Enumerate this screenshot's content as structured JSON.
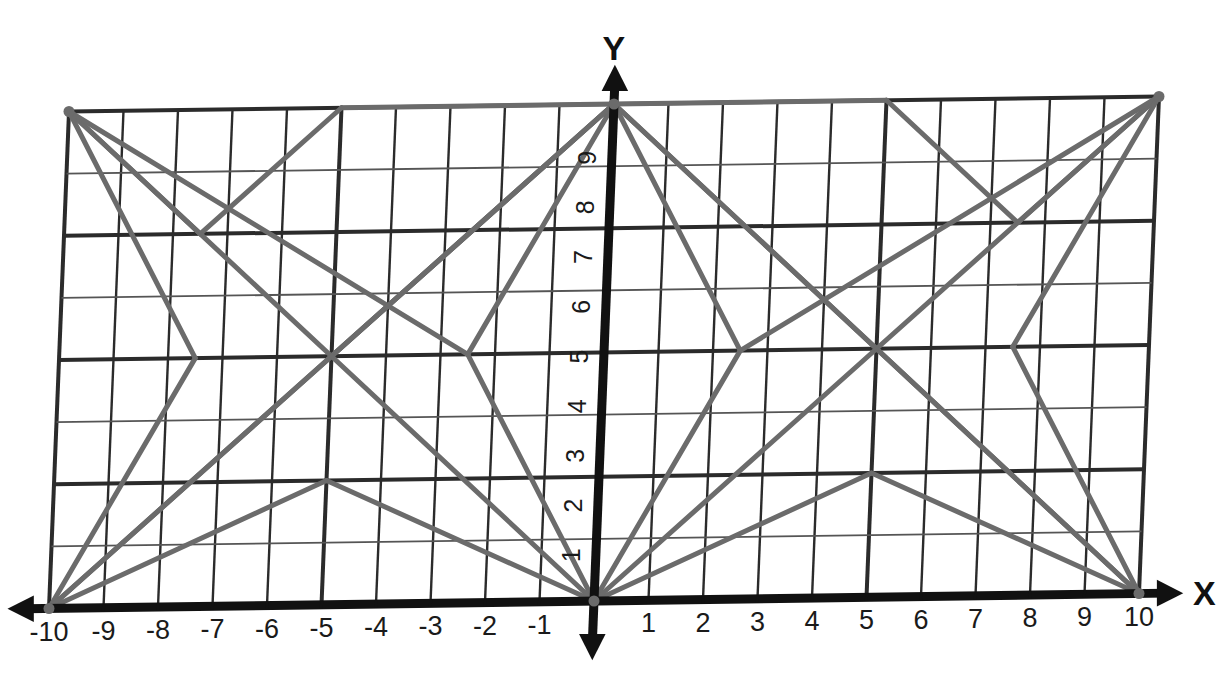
{
  "figure": {
    "title": "",
    "type": "coordinate-plane-line-figure",
    "axis_labels": {
      "x": "X",
      "y": "Y"
    },
    "colors": {
      "grid_major": "#2b2b2b",
      "grid_minor": "#555555",
      "axis": "#111111",
      "figure_line": "#6b6b6b",
      "background": "#ffffff"
    }
  },
  "chart_data": {
    "type": "line",
    "title": "",
    "xlabel": "X",
    "ylabel": "Y",
    "xlim": [
      -10,
      10
    ],
    "ylim": [
      0,
      10
    ],
    "grid": true,
    "legend": "none",
    "x_ticks": [
      "-10",
      "-9",
      "-8",
      "-7",
      "-6",
      "-5",
      "-4",
      "-3",
      "-2",
      "-1",
      "0",
      "1",
      "2",
      "3",
      "4",
      "5",
      "6",
      "7",
      "8",
      "9",
      "10"
    ],
    "y_ticks": [
      "1",
      "2",
      "3",
      "4",
      "5",
      "6",
      "7",
      "8",
      "9"
    ],
    "x_tick_values": [
      -10,
      -9,
      -8,
      -7,
      -6,
      -5,
      -4,
      -3,
      -2,
      -1,
      0,
      1,
      2,
      3,
      4,
      5,
      6,
      7,
      8,
      9,
      10
    ],
    "y_tick_values": [
      1,
      2,
      3,
      4,
      5,
      6,
      7,
      8,
      9
    ],
    "key_points": [
      {
        "name": "top-left-corner",
        "x": -10,
        "y": 10
      },
      {
        "name": "top-center-apex",
        "x": 0,
        "y": 10
      },
      {
        "name": "top-right-corner",
        "x": 10,
        "y": 10
      },
      {
        "name": "left-wing-notch",
        "x": -7.5,
        "y": 7.5
      },
      {
        "name": "right-wing-notch",
        "x": 7.5,
        "y": 7.5
      },
      {
        "name": "left-mid-node",
        "x": -7.5,
        "y": 5
      },
      {
        "name": "right-mid-node",
        "x": 7.5,
        "y": 5
      },
      {
        "name": "left-cross-center",
        "x": -5,
        "y": 5
      },
      {
        "name": "right-cross-center",
        "x": 5,
        "y": 5
      },
      {
        "name": "inner-left-node",
        "x": -2.5,
        "y": 5
      },
      {
        "name": "inner-right-node",
        "x": 2.5,
        "y": 5
      },
      {
        "name": "left-peak",
        "x": -5,
        "y": 2.5
      },
      {
        "name": "right-peak",
        "x": 5,
        "y": 2.5
      },
      {
        "name": "bottom-left-corner",
        "x": -10,
        "y": 0
      },
      {
        "name": "origin",
        "x": 0,
        "y": 0
      },
      {
        "name": "bottom-right-corner",
        "x": 10,
        "y": 0
      }
    ],
    "segments": [
      {
        "from": [
          -10,
          10
        ],
        "to": [
          -7.5,
          7.5
        ]
      },
      {
        "from": [
          -7.5,
          7.5
        ],
        "to": [
          -5,
          10
        ]
      },
      {
        "from": [
          -5,
          10
        ],
        "to": [
          0,
          10
        ]
      },
      {
        "from": [
          -10,
          10
        ],
        "to": [
          -5,
          5
        ]
      },
      {
        "from": [
          -5,
          5
        ],
        "to": [
          0,
          10
        ]
      },
      {
        "from": [
          -10,
          10
        ],
        "to": [
          -2.5,
          5
        ]
      },
      {
        "from": [
          -2.5,
          5
        ],
        "to": [
          0,
          10
        ]
      },
      {
        "from": [
          -10,
          10
        ],
        "to": [
          -7.5,
          5
        ]
      },
      {
        "from": [
          -7.5,
          5
        ],
        "to": [
          -10,
          0
        ]
      },
      {
        "from": [
          -10,
          0
        ],
        "to": [
          -5,
          5
        ]
      },
      {
        "from": [
          -5,
          5
        ],
        "to": [
          0,
          10
        ]
      },
      {
        "from": [
          -10,
          0
        ],
        "to": [
          -5,
          2.5
        ]
      },
      {
        "from": [
          -5,
          2.5
        ],
        "to": [
          0,
          0
        ]
      },
      {
        "from": [
          -10,
          0
        ],
        "to": [
          0,
          10
        ]
      },
      {
        "from": [
          -2.5,
          5
        ],
        "to": [
          0,
          0
        ]
      },
      {
        "from": [
          0,
          0
        ],
        "to": [
          -5,
          5
        ]
      },
      {
        "from": [
          10,
          10
        ],
        "to": [
          7.5,
          7.5
        ]
      },
      {
        "from": [
          7.5,
          7.5
        ],
        "to": [
          5,
          10
        ]
      },
      {
        "from": [
          5,
          10
        ],
        "to": [
          0,
          10
        ]
      },
      {
        "from": [
          10,
          10
        ],
        "to": [
          5,
          5
        ]
      },
      {
        "from": [
          5,
          5
        ],
        "to": [
          0,
          10
        ]
      },
      {
        "from": [
          10,
          10
        ],
        "to": [
          2.5,
          5
        ]
      },
      {
        "from": [
          2.5,
          5
        ],
        "to": [
          0,
          10
        ]
      },
      {
        "from": [
          10,
          10
        ],
        "to": [
          7.5,
          5
        ]
      },
      {
        "from": [
          7.5,
          5
        ],
        "to": [
          10,
          0
        ]
      },
      {
        "from": [
          10,
          0
        ],
        "to": [
          5,
          5
        ]
      },
      {
        "from": [
          10,
          0
        ],
        "to": [
          5,
          2.5
        ]
      },
      {
        "from": [
          5,
          2.5
        ],
        "to": [
          0,
          0
        ]
      },
      {
        "from": [
          10,
          0
        ],
        "to": [
          0,
          10
        ]
      },
      {
        "from": [
          2.5,
          5
        ],
        "to": [
          0,
          0
        ]
      },
      {
        "from": [
          0,
          0
        ],
        "to": [
          5,
          5
        ]
      }
    ]
  }
}
